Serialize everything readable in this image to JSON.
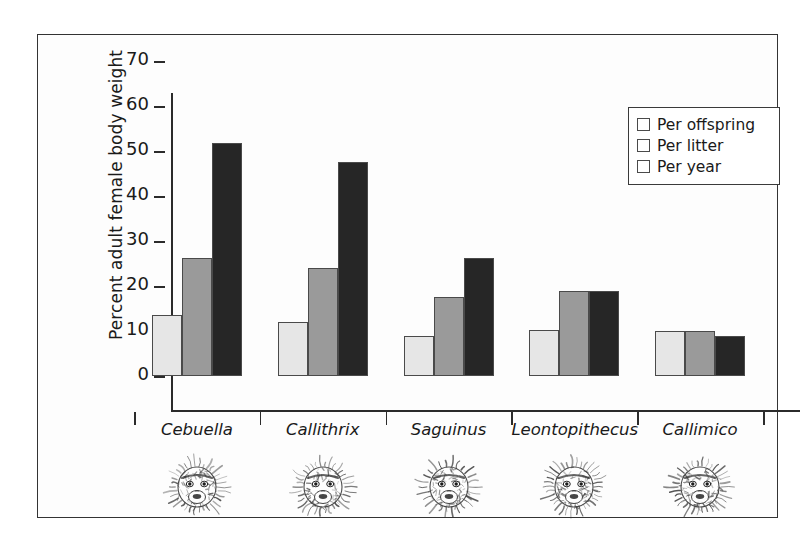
{
  "chart_data": {
    "type": "bar",
    "title": "",
    "xlabel": "",
    "ylabel": "Percent adult female body weight",
    "ylim": [
      0,
      70
    ],
    "yticks": [
      0,
      10,
      20,
      30,
      40,
      50,
      60,
      70
    ],
    "grid": false,
    "legend_position": "top-right",
    "categories": [
      "Cebuella",
      "Callithrix",
      "Saguinus",
      "Leontopithecus",
      "Callimico"
    ],
    "series": [
      {
        "name": "Per offspring",
        "color": "#e6e6e6",
        "values": [
          13.5,
          12.0,
          9.0,
          10.3,
          10.0
        ]
      },
      {
        "name": "Per litter",
        "color": "#9a9a9a",
        "values": [
          26.2,
          24.0,
          17.5,
          19.0,
          10.0
        ]
      },
      {
        "name": "Per year",
        "color": "#262626",
        "values": [
          51.8,
          47.5,
          26.2,
          19.0,
          9.0
        ]
      }
    ]
  },
  "axis": {
    "y_title": "Percent adult female body weight",
    "tick_labels": [
      "70",
      "60",
      "50",
      "40",
      "30",
      "20",
      "10",
      "0"
    ]
  },
  "legend": {
    "items": [
      {
        "label": "Per offspring",
        "swatch": "light-gray-swatch"
      },
      {
        "label": "Per litter",
        "swatch": "medium-gray-swatch"
      },
      {
        "label": "Per year",
        "swatch": "dark-gray-swatch"
      }
    ]
  },
  "categories": [
    {
      "label": "Cebuella",
      "illustration": "marmoset-face-sketch"
    },
    {
      "label": "Callithrix",
      "illustration": "marmoset-face-sketch"
    },
    {
      "label": "Saguinus",
      "illustration": "tamarin-face-sketch"
    },
    {
      "label": "Leontopithecus",
      "illustration": "lion-tamarin-face-sketch"
    },
    {
      "label": "Callimico",
      "illustration": "goeldis-monkey-face-sketch"
    }
  ],
  "colors": {
    "series_light": "#e6e6e6",
    "series_medium": "#9a9a9a",
    "series_dark": "#262626",
    "axis": "#2b2b2b",
    "frame": "#333333"
  }
}
